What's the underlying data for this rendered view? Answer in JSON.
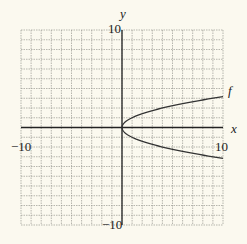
{
  "chart_data": {
    "type": "line",
    "title": "",
    "xlabel": "x",
    "ylabel": "y",
    "xlim": [
      -10,
      10
    ],
    "ylim": [
      -10,
      10
    ],
    "grid": true,
    "grid_step": 1,
    "tick_labels": {
      "x_min": "−10",
      "x_max": "10",
      "y_min": "−10",
      "y_max": "10"
    },
    "series": [
      {
        "name": "f",
        "equation": "x = y^2",
        "x": [
          0,
          0.25,
          1,
          2.25,
          4,
          6.25,
          9,
          10,
          0.25,
          1,
          2.25,
          4,
          6.25,
          9,
          10
        ],
        "y": [
          0,
          0.5,
          1,
          1.5,
          2,
          2.5,
          3,
          3.16,
          -0.5,
          -1,
          -1.5,
          -2,
          -2.5,
          -3,
          -3.16
        ]
      }
    ],
    "annotations": [
      {
        "text": "f",
        "x": 10,
        "y": 3.8
      }
    ],
    "legend": "none"
  },
  "colors": {
    "background": "#fbf9ef",
    "grid": "#9a9a92",
    "axis": "#222222",
    "curve": "#333333"
  }
}
